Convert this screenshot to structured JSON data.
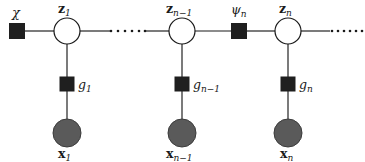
{
  "figure": {
    "kind": "factor-graph",
    "background": "#ffffff",
    "ink": "#1a1a1a",
    "observed_fill": "#5a5a5a",
    "hidden_fill": "#ffffff"
  },
  "labels": {
    "chi": "χ",
    "psi_n": "ψ",
    "psi_n_sub": "n",
    "z1": "z",
    "z1_sub": "1",
    "zn1": "z",
    "zn1_sub": "n−1",
    "zn": "z",
    "zn_sub": "n",
    "g1": "g",
    "g1_sub": "1",
    "gn1": "g",
    "gn1_sub": "n−1",
    "gn": "g",
    "gn_sub": "n",
    "x1": "x",
    "x1_sub": "1",
    "xn1": "x",
    "xn1_sub": "n−1",
    "xn": "x",
    "xn_sub": "n"
  },
  "nodes": {
    "prior_factor": {
      "name": "chi",
      "type": "factor-square",
      "x": 17,
      "y": 31,
      "size": 15
    },
    "psi_factor": {
      "name": "psi_n",
      "type": "factor-square",
      "x": 239,
      "y": 31,
      "size": 15
    },
    "z1": {
      "type": "variable-circle",
      "x": 67,
      "y": 31,
      "r": 13,
      "observed": false
    },
    "zn1": {
      "type": "variable-circle",
      "x": 182,
      "y": 31,
      "r": 13,
      "observed": false
    },
    "zn": {
      "type": "variable-circle",
      "x": 288,
      "y": 31,
      "r": 13,
      "observed": false
    },
    "g1": {
      "type": "factor-square",
      "x": 67,
      "y": 84,
      "size": 14
    },
    "gn1": {
      "type": "factor-square",
      "x": 182,
      "y": 84,
      "size": 14
    },
    "gn": {
      "type": "factor-square",
      "x": 288,
      "y": 84,
      "size": 14
    },
    "x1": {
      "type": "variable-circle",
      "x": 67,
      "y": 133,
      "r": 14,
      "observed": true
    },
    "xn1": {
      "type": "variable-circle",
      "x": 182,
      "y": 133,
      "r": 14,
      "observed": true
    },
    "xn": {
      "type": "variable-circle",
      "x": 288,
      "y": 133,
      "r": 14,
      "observed": true
    }
  },
  "edges": [
    {
      "from": "prior_factor",
      "to": "z1"
    },
    {
      "from": "z1",
      "to": "dots_left"
    },
    {
      "from": "dots_left",
      "to": "zn1"
    },
    {
      "from": "zn1",
      "to": "psi_factor"
    },
    {
      "from": "psi_factor",
      "to": "zn"
    },
    {
      "from": "zn",
      "to": "dots_right"
    },
    {
      "from": "z1",
      "to": "g1"
    },
    {
      "from": "g1",
      "to": "x1"
    },
    {
      "from": "zn1",
      "to": "gn1"
    },
    {
      "from": "gn1",
      "to": "xn1"
    },
    {
      "from": "zn",
      "to": "gn"
    },
    {
      "from": "gn",
      "to": "xn"
    }
  ],
  "ellipses": {
    "left": {
      "count": 6,
      "x_start": 110,
      "x_end": 145,
      "y": 31,
      "r": 1.3
    },
    "right": {
      "count": 6,
      "x_start": 330,
      "x_end": 362,
      "y": 31,
      "r": 1.3
    }
  }
}
